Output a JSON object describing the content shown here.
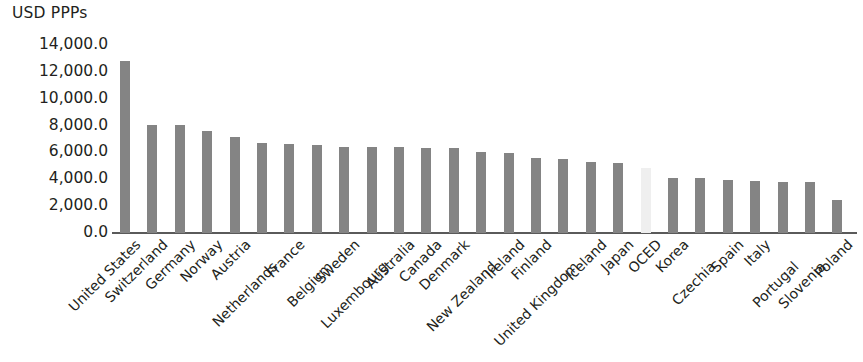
{
  "chart_data": {
    "type": "bar",
    "title": "",
    "ylabel": "USD PPPs",
    "xlabel": "",
    "ylim": [
      0,
      14000
    ],
    "yticks": [
      "0.0",
      "2,000.0",
      "4,000.0",
      "6,000.0",
      "8,000.0",
      "10,000.0",
      "12,000.0",
      "14,000.0"
    ],
    "ytick_values": [
      0,
      2000,
      4000,
      6000,
      8000,
      10000,
      12000,
      14000
    ],
    "grid": false,
    "legend": "none",
    "bar_color": "#848484",
    "highlight_color": "#efefef",
    "highlight_category": "OCED",
    "categories": [
      "United States",
      "Switzerland",
      "Germany",
      "Norway",
      "Austria",
      "Netherlands",
      "France",
      "Belgium",
      "Sweden",
      "Luxembourg",
      "Australia",
      "Canada",
      "Denmark",
      "New Zealand",
      "Ireland",
      "Finland",
      "United Kingdom",
      "Iceland",
      "Japan",
      "OCED",
      "Korea",
      "Czechia",
      "Spain",
      "Italy",
      "Portugal",
      "Slovenia",
      "Poland"
    ],
    "values": [
      12830,
      8080,
      8040,
      7560,
      7160,
      6710,
      6600,
      6570,
      6440,
      6420,
      6380,
      6330,
      6300,
      6000,
      5950,
      5600,
      5480,
      5260,
      5180,
      4850,
      4130,
      4060,
      3970,
      3880,
      3830,
      3790,
      2490
    ]
  },
  "axis": {
    "y_title": "USD PPPs"
  }
}
